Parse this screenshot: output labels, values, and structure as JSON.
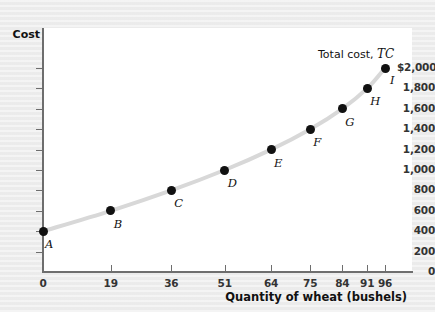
{
  "chart_data": {
    "type": "line",
    "title": "",
    "xlabel": "Quantity of wheat (bushels)",
    "ylabel": "Cost",
    "xlim": [
      0,
      104
    ],
    "ylim": [
      0,
      2100
    ],
    "grid": false,
    "legend_position": "inline-annotation",
    "series_annotation": "Total cost, TC",
    "series_annotation_plain": "Total cost,",
    "series_annotation_italic": "TC",
    "x_ticks": [
      0,
      19,
      36,
      51,
      64,
      75,
      84,
      91,
      96
    ],
    "x_tick_labels": [
      "0",
      "19",
      "36",
      "51",
      "64",
      "75",
      "84",
      "91",
      "96"
    ],
    "y_ticks": [
      0,
      200,
      400,
      600,
      800,
      1000,
      1200,
      1400,
      1600,
      1800,
      2000
    ],
    "y_tick_labels": [
      "0",
      "200",
      "400",
      "600",
      "800",
      "1,000",
      "1,200",
      "1,400",
      "1,600",
      "1,800",
      "$2,000"
    ],
    "series": [
      {
        "name": "Total cost, TC",
        "color": "#d8d8d8",
        "point_color": "#111111",
        "points": [
          {
            "label": "A",
            "x": 0,
            "y": 400
          },
          {
            "label": "B",
            "x": 19,
            "y": 600
          },
          {
            "label": "C",
            "x": 36,
            "y": 800
          },
          {
            "label": "D",
            "x": 51,
            "y": 1000
          },
          {
            "label": "E",
            "x": 64,
            "y": 1200
          },
          {
            "label": "F",
            "x": 75,
            "y": 1400
          },
          {
            "label": "G",
            "x": 84,
            "y": 1600
          },
          {
            "label": "H",
            "x": 91,
            "y": 1800
          },
          {
            "label": "I",
            "x": 96,
            "y": 2000
          }
        ]
      }
    ],
    "colors": {
      "plot_background": "#ffffff",
      "figure_background": "#eeeeee",
      "axis": "#6e6e6e",
      "curve": "#d8d8d8",
      "point": "#111111",
      "text": "#111111"
    }
  }
}
